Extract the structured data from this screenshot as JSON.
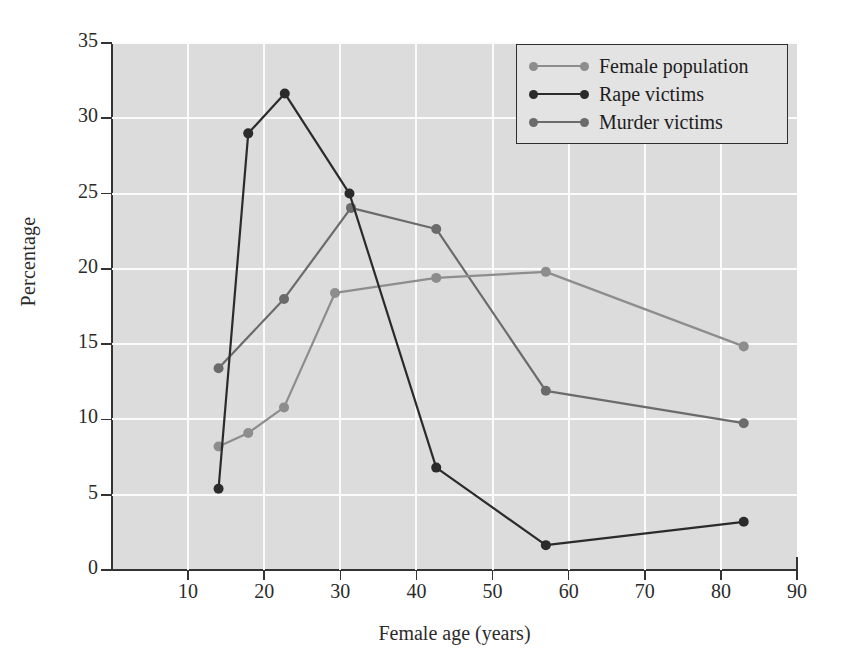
{
  "chart_data": {
    "type": "line",
    "title": "",
    "xlabel": "Female age (years)",
    "ylabel": "Percentage",
    "xlim": [
      0,
      90
    ],
    "ylim": [
      0,
      35
    ],
    "xticks": [
      10,
      20,
      30,
      40,
      50,
      60,
      70,
      80,
      90
    ],
    "yticks": [
      0,
      5,
      10,
      15,
      20,
      25,
      30,
      35
    ],
    "grid": true,
    "legend_position": "top-right",
    "series": [
      {
        "name": "Female population",
        "color": "#8d8d8d",
        "points": [
          {
            "x": 14.0,
            "y": 8.2
          },
          {
            "x": 17.9,
            "y": 9.1
          },
          {
            "x": 22.6,
            "y": 10.8
          },
          {
            "x": 29.3,
            "y": 18.4
          },
          {
            "x": 42.6,
            "y": 19.4
          },
          {
            "x": 57.0,
            "y": 19.8
          },
          {
            "x": 83.0,
            "y": 14.85
          }
        ]
      },
      {
        "name": "Rape victims",
        "color": "#2b2b2b",
        "points": [
          {
            "x": 14.0,
            "y": 5.4
          },
          {
            "x": 17.9,
            "y": 29.0
          },
          {
            "x": 22.7,
            "y": 31.65
          },
          {
            "x": 31.2,
            "y": 25.0
          },
          {
            "x": 42.6,
            "y": 6.8
          },
          {
            "x": 57.0,
            "y": 1.65
          },
          {
            "x": 83.0,
            "y": 3.2
          }
        ]
      },
      {
        "name": "Murder victims",
        "color": "#6b6b6b",
        "points": [
          {
            "x": 14.0,
            "y": 13.4
          },
          {
            "x": 22.6,
            "y": 18.0
          },
          {
            "x": 31.4,
            "y": 24.05
          },
          {
            "x": 42.6,
            "y": 22.65
          },
          {
            "x": 57.0,
            "y": 11.9
          },
          {
            "x": 83.0,
            "y": 9.75
          }
        ]
      }
    ]
  },
  "legend": {
    "items": [
      {
        "label": "Female population"
      },
      {
        "label": "Rape victims"
      },
      {
        "label": "Murder victims"
      }
    ]
  },
  "axes": {
    "x_title": "Female age (years)",
    "y_title": "Percentage"
  },
  "colors": {
    "plot_background": "#dcdcdc",
    "gridline": "#fbfbfb",
    "axis": "#333333",
    "female_population": "#8d8d8d",
    "rape_victims": "#2b2b2b",
    "murder_victims": "#6b6b6b"
  }
}
